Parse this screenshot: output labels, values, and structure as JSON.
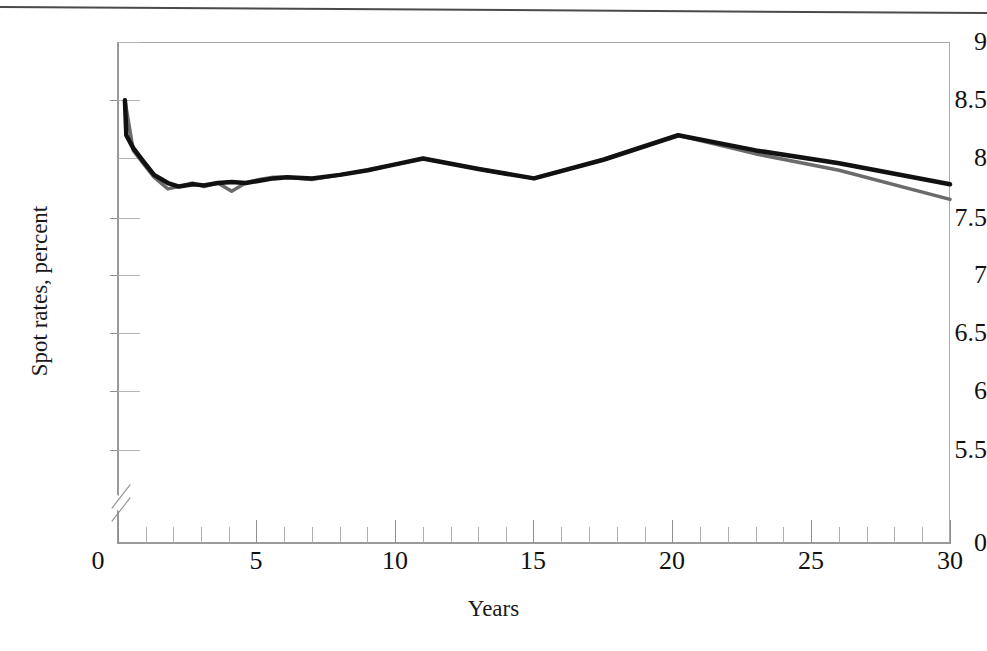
{
  "figure": {
    "x_axis_title": "Years",
    "y_axis_title": "Spot rates, percent",
    "y_tick_labels": [
      "9",
      "8.5",
      "8",
      "7.5",
      "7",
      "6.5",
      "6",
      "5.5",
      "0"
    ],
    "x_tick_labels": [
      "0",
      "5",
      "10",
      "15",
      "20",
      "25",
      "30"
    ],
    "axis_break_label": "axis-break-between-5.5-and-0"
  },
  "chart_data": {
    "type": "line",
    "title": "",
    "xlabel": "Years",
    "ylabel": "Spot rates, percent",
    "xlim": [
      0,
      30
    ],
    "ylim": [
      5.5,
      9
    ],
    "y_axis_break": {
      "from": 0,
      "to": 5.5
    },
    "y_ticks": [
      5.5,
      6,
      6.5,
      7,
      7.5,
      8,
      8.5,
      9
    ],
    "y_tick_labels": [
      "5.5",
      "6",
      "6.5",
      "7",
      "7.5",
      "8",
      "8.5",
      "9"
    ],
    "zero_tick_label": "0",
    "x_ticks": [
      0,
      5,
      10,
      15,
      20,
      25,
      30
    ],
    "x_minor_tick_step": 1,
    "grid": false,
    "legend": "none",
    "series": [
      {
        "name": "black-curve",
        "color": "#111111",
        "width": 4.5,
        "x": [
          0.25,
          0.3,
          0.55,
          0.9,
          1.3,
          1.8,
          2.2,
          2.7,
          3.1,
          3.6,
          4.1,
          4.6,
          5.1,
          5.6,
          6.1,
          7.0,
          8.0,
          9.0,
          10.0,
          11.0,
          13.0,
          15.0,
          17.5,
          20.2,
          23.0,
          26.0,
          30.0
        ],
        "y": [
          8.5,
          8.2,
          8.09,
          7.98,
          7.86,
          7.79,
          7.76,
          7.78,
          7.77,
          7.79,
          7.8,
          7.79,
          7.81,
          7.83,
          7.84,
          7.83,
          7.86,
          7.9,
          7.95,
          8.0,
          7.91,
          7.83,
          7.99,
          8.2,
          8.07,
          7.96,
          7.78
        ]
      },
      {
        "name": "gray-curve",
        "color": "#6b6b6b",
        "width": 3.5,
        "x": [
          0.25,
          0.55,
          0.9,
          1.3,
          1.8,
          2.2,
          2.7,
          3.1,
          3.6,
          4.1,
          4.6,
          5.1,
          5.6,
          6.1,
          7.0,
          8.0,
          9.0,
          10.0,
          11.0,
          13.0,
          15.0,
          17.5,
          20.2,
          23.0,
          26.0,
          30.0
        ],
        "y": [
          8.5,
          8.07,
          7.96,
          7.84,
          7.74,
          7.76,
          7.79,
          7.76,
          7.79,
          7.72,
          7.79,
          7.82,
          7.84,
          7.84,
          7.82,
          7.86,
          7.9,
          7.95,
          8.0,
          7.91,
          7.83,
          7.99,
          8.2,
          8.04,
          7.9,
          7.65
        ]
      }
    ]
  }
}
